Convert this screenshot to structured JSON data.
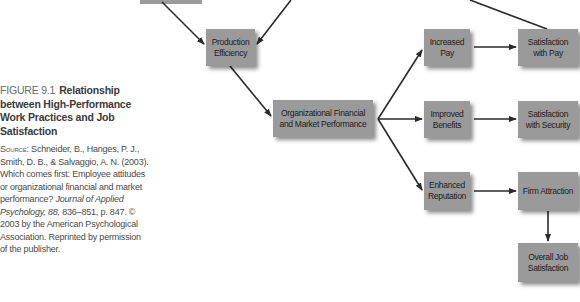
{
  "caption": {
    "figure_label": "FIGURE 9.1",
    "title": "Relationship between High-Performance Work Practices and Job Satisfaction",
    "source_label": "Source:",
    "source_text_1": "Schneider, B., Hanges, P. J., Smith, D. B., & Salvaggio, A. N. (2003). Which comes first: Employee attitudes or organizational financial and market performance?",
    "source_journal": "Journal of Applied Psychology, 88,",
    "source_text_2": "836–851, p. 847. © 2003 by the American Psychological Association. Reprinted by permission of the publisher."
  },
  "nodes": {
    "production_efficiency": "Production Efficiency",
    "org_performance": "Organizational Financial and Market Performance",
    "increased_pay": "Increased Pay",
    "improved_benefits": "Improved Benefits",
    "enhanced_reputation": "Enhanced Reputation",
    "satisfaction_pay": "Satisfaction with Pay",
    "satisfaction_security": "Satisfaction with Security",
    "firm_attraction": "Firm Attraction",
    "overall_job_satisfaction": "Overall Job Satisfaction"
  },
  "edges": [
    [
      "top_partial_box",
      "production_efficiency"
    ],
    [
      "top_offscreen",
      "production_efficiency"
    ],
    [
      "production_efficiency",
      "org_performance"
    ],
    [
      "org_performance",
      "increased_pay"
    ],
    [
      "org_performance",
      "improved_benefits"
    ],
    [
      "org_performance",
      "enhanced_reputation"
    ],
    [
      "increased_pay",
      "satisfaction_pay"
    ],
    [
      "improved_benefits",
      "satisfaction_security"
    ],
    [
      "enhanced_reputation",
      "firm_attraction"
    ],
    [
      "firm_attraction",
      "overall_job_satisfaction"
    ],
    [
      "top_offscreen_right",
      "satisfaction_pay"
    ]
  ],
  "colors": {
    "box_fill": "#9a9a9a",
    "arrow": "#2a2a2a",
    "caption_text": "#3a3a3a"
  }
}
